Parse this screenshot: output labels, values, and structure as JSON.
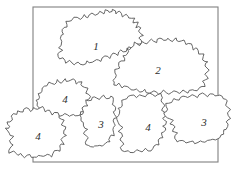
{
  "figure": {
    "background_color": "#ffffff",
    "outline_color": "#4a4a4a",
    "frame_color": "#808080",
    "label_color": "#2e2e2e"
  },
  "frame": {
    "name": "bounding-rectangle",
    "x": 33,
    "y": 7,
    "width": 185,
    "height": 155
  },
  "regions": [
    {
      "id": "region-1",
      "label": "1",
      "label_x": 96,
      "label_y": 46,
      "outline": "M 62,45 L 60,38 L 64,34 L 62,29 L 67,27 L 66,22 L 72,21 L 74,17 L 80,19 L 84,15 L 88,18 L 92,13 L 96,16 L 100,11 L 104,14 L 106,9 L 110,13 L 113,9 L 116,14 L 120,11 L 122,16 L 127,14 L 129,19 L 134,18 L 133,23 L 138,22 L 136,27 L 141,28 L 138,32 L 143,35 L 139,38 L 142,43 L 136,44 L 134,49 L 129,47 L 126,52 L 121,50 L 118,55 L 113,53 L 110,58 L 105,56 L 101,61 L 96,59 L 92,63 L 87,61 L 83,65 L 78,62 L 74,65 L 70,61 L 66,63 L 63,58 L 59,59 L 58,54 L 62,51 L 59,48 Z"
    },
    {
      "id": "region-2",
      "label": "2",
      "label_x": 158,
      "label_y": 70,
      "outline": "M 113,80 L 117,75 L 115,70 L 120,68 L 119,63 L 124,61 L 123,56 L 128,54 L 127,49 L 132,48 L 134,43 L 139,45 L 143,41 L 147,44 L 151,40 L 156,42 L 160,38 L 164,41 L 168,38 L 172,41 L 176,38 L 179,42 L 184,40 L 186,45 L 191,44 L 193,49 L 198,48 L 199,53 L 204,54 L 203,59 L 208,62 L 205,66 L 209,70 L 205,74 L 208,78 L 203,81 L 205,86 L 199,87 L 197,91 L 192,89 L 188,93 L 183,90 L 179,94 L 174,91 L 169,94 L 164,91 L 159,94 L 154,91 L 149,94 L 145,90 L 140,92 L 136,88 L 131,90 L 127,86 L 122,88 L 119,84 L 114,85 Z"
    },
    {
      "id": "region-4-upper",
      "label": "4",
      "label_x": 65,
      "label_y": 99,
      "outline": "M 38,105 L 36,100 L 40,97 L 38,93 L 43,91 L 42,87 L 47,86 L 49,82 L 54,84 L 57,80 L 61,83 L 65,79 L 69,82 L 73,79 L 76,83 L 81,82 L 82,87 L 87,88 L 86,93 L 90,96 L 87,100 L 90,104 L 85,107 L 86,112 L 81,112 L 78,116 L 73,114 L 69,117 L 65,114 L 60,116 L 56,113 L 51,115 L 47,112 L 43,113 L 41,109 Z"
    },
    {
      "id": "region-4-left",
      "label": "4",
      "label_x": 38,
      "label_y": 136,
      "outline": "M 9,133 L 6,129 L 10,126 L 7,122 L 12,120 L 11,115 L 16,114 L 18,110 L 23,112 L 26,108 L 30,111 L 34,107 L 38,110 L 42,107 L 45,111 L 50,110 L 52,114 L 57,113 L 59,118 L 64,120 L 62,124 L 66,127 L 63,131 L 66,135 L 62,139 L 64,144 L 59,146 L 60,151 L 55,151 L 52,156 L 47,154 L 43,157 L 38,155 L 34,158 L 30,155 L 25,157 L 21,154 L 17,156 L 14,152 L 10,153 L 9,148 L 13,145 L 10,141 L 13,137 Z"
    },
    {
      "id": "region-3-middle",
      "label": "3",
      "label_x": 101,
      "label_y": 124,
      "outline": "M 82,120 L 80,115 L 84,112 L 82,108 L 87,106 L 86,101 L 91,100 L 95,96 L 99,99 L 103,96 L 107,99 L 111,96 L 114,100 L 112,105 L 116,108 L 113,112 L 116,117 L 113,121 L 116,126 L 112,130 L 114,135 L 109,137 L 110,142 L 105,143 L 102,147 L 97,145 L 93,148 L 88,146 L 85,142 L 88,138 L 84,134 L 87,130 L 83,126 Z"
    },
    {
      "id": "region-4-lower",
      "label": "4",
      "label_x": 148,
      "label_y": 127,
      "outline": "M 118,122 L 116,117 L 120,113 L 118,108 L 123,106 L 122,101 L 127,99 L 131,95 L 136,97 L 140,94 L 145,96 L 150,93 L 155,96 L 160,94 L 163,98 L 161,103 L 165,106 L 162,110 L 166,114 L 163,118 L 167,122 L 163,126 L 166,131 L 161,133 L 163,138 L 158,140 L 159,145 L 154,146 L 151,151 L 146,149 L 142,152 L 137,150 L 133,153 L 128,150 L 124,152 L 121,148 L 124,144 L 120,140 L 123,136 L 119,132 L 122,128 Z"
    },
    {
      "id": "region-3-right",
      "label": "3",
      "label_x": 204,
      "label_y": 122,
      "outline": "M 166,118 L 164,113 L 168,109 L 166,104 L 171,102 L 174,98 L 179,100 L 183,96 L 188,98 L 192,95 L 197,97 L 202,94 L 207,96 L 211,93 L 215,96 L 220,95 L 223,99 L 228,101 L 226,105 L 230,109 L 227,113 L 230,118 L 226,122 L 228,127 L 223,130 L 224,135 L 219,137 L 215,141 L 210,139 L 205,142 L 200,140 L 195,143 L 190,141 L 186,143 L 182,140 L 177,142 L 174,138 L 177,134 L 172,131 L 175,127 L 170,124 L 173,121 Z"
    }
  ]
}
